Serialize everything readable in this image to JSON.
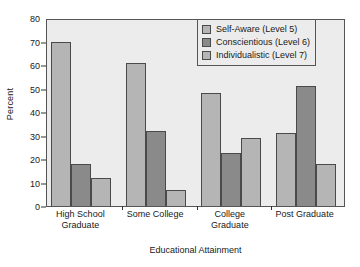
{
  "chart_data": {
    "type": "bar",
    "title": "",
    "xlabel": "Educational Attainment",
    "ylabel": "Percent",
    "categories": [
      "High School\nGraduate",
      "Some College",
      "College\nGraduate",
      "Post Graduate"
    ],
    "category_lines": [
      [
        "High School",
        "Graduate"
      ],
      [
        "Some College",
        ""
      ],
      [
        "College",
        "Graduate"
      ],
      [
        "Post Graduate",
        ""
      ]
    ],
    "series": [
      {
        "name": "Self-Aware (Level 5)",
        "color": "#b5b5b5",
        "values": [
          70,
          61,
          48,
          31
        ]
      },
      {
        "name": "Conscientious (Level 6)",
        "color": "#8a8a8a",
        "values": [
          18,
          32,
          22.5,
          51
        ]
      },
      {
        "name": "Individualistic (Level 7)",
        "color": "#b5b5b5",
        "values": [
          12,
          7,
          29,
          18
        ]
      }
    ],
    "ylim": [
      0,
      80
    ],
    "ytick_values": [
      0,
      10,
      20,
      30,
      40,
      50,
      60,
      70,
      80
    ],
    "ytick_labels": [
      "0",
      "10",
      "20",
      "30",
      "40",
      "50",
      "60",
      "70",
      "80"
    ],
    "grid": false,
    "legend_position": "upper right",
    "legend_entries": [
      "Self-Aware (Level 5)",
      "Conscientious (Level 6)",
      "Individualistic (Level 7)"
    ],
    "plot_background": "#ececec",
    "figure_background": "#ffffff",
    "axis_color": "#555555",
    "bar_edge_color": "#4a4a4a"
  }
}
